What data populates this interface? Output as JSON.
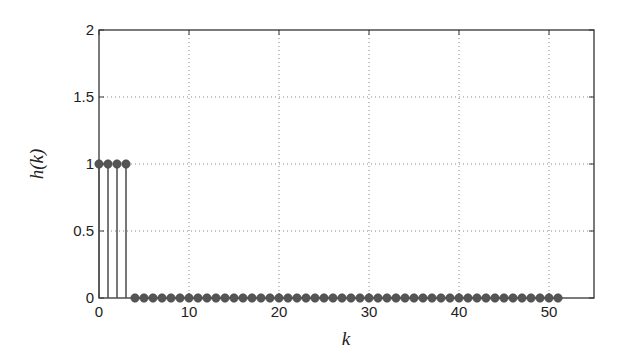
{
  "chart_data": {
    "type": "stem",
    "title": "",
    "xlabel": "k",
    "ylabel": "h(k)",
    "xlim": [
      0,
      55
    ],
    "ylim": [
      0,
      2
    ],
    "xticks": [
      0,
      10,
      20,
      30,
      40,
      50
    ],
    "yticks": [
      0,
      0.5,
      1,
      1.5,
      2
    ],
    "xtick_labels": [
      "0",
      "10",
      "20",
      "30",
      "40",
      "50"
    ],
    "ytick_labels": [
      "0",
      "0.5",
      "1",
      "1.5",
      "2"
    ],
    "grid": true,
    "x": [
      0,
      1,
      2,
      3,
      4,
      5,
      6,
      7,
      8,
      9,
      10,
      11,
      12,
      13,
      14,
      15,
      16,
      17,
      18,
      19,
      20,
      21,
      22,
      23,
      24,
      25,
      26,
      27,
      28,
      29,
      30,
      31,
      32,
      33,
      34,
      35,
      36,
      37,
      38,
      39,
      40,
      41,
      42,
      43,
      44,
      45,
      46,
      47,
      48,
      49,
      50,
      51
    ],
    "values": [
      1,
      1,
      1,
      1,
      0,
      0,
      0,
      0,
      0,
      0,
      0,
      0,
      0,
      0,
      0,
      0,
      0,
      0,
      0,
      0,
      0,
      0,
      0,
      0,
      0,
      0,
      0,
      0,
      0,
      0,
      0,
      0,
      0,
      0,
      0,
      0,
      0,
      0,
      0,
      0,
      0,
      0,
      0,
      0,
      0,
      0,
      0,
      0,
      0,
      0,
      0,
      0
    ],
    "colors": {
      "stem": "#555555",
      "axes": "#333333",
      "grid": "#888888"
    }
  }
}
